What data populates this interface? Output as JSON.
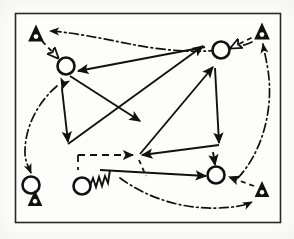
{
  "figure": {
    "background_color": "#fdfdfc",
    "ink_color": "#111111",
    "canvas": {
      "width": 294,
      "height": 239
    }
  },
  "frame": {
    "name": "border-frame",
    "x": 15,
    "y": 13,
    "width": 265,
    "height": 209,
    "stroke": "#2a2a2a",
    "stroke_width": 1.6
  },
  "nodes": {
    "circles": [
      {
        "id": "c1",
        "label": "",
        "cx": 66,
        "cy": 66,
        "r": 8.5
      },
      {
        "id": "c2",
        "label": "",
        "cx": 221,
        "cy": 50,
        "r": 8.5
      },
      {
        "id": "c3",
        "label": "",
        "cx": 31,
        "cy": 185,
        "r": 8.5
      },
      {
        "id": "c4",
        "label": "",
        "cx": 82,
        "cy": 186,
        "r": 8.5
      },
      {
        "id": "c5",
        "label": "",
        "cx": 216,
        "cy": 175,
        "r": 8.5
      }
    ],
    "triangles": [
      {
        "id": "t1",
        "label": "",
        "cx": 36,
        "cy": 33,
        "size": 8.5
      },
      {
        "id": "t2",
        "label": "",
        "cx": 262,
        "cy": 31,
        "size": 8.5
      },
      {
        "id": "t3",
        "label": "",
        "cx": 35,
        "cy": 198,
        "size": 8.0
      },
      {
        "id": "t4",
        "label": "",
        "cx": 262,
        "cy": 189,
        "size": 8.0
      }
    ]
  },
  "edges": {
    "solid": [
      {
        "id": "s1",
        "from": "c2",
        "to": "c1",
        "style": "solid"
      },
      {
        "id": "s2",
        "from": "c1",
        "to": "mid-right",
        "style": "solid"
      },
      {
        "id": "s3",
        "from": "left-spine-top",
        "to": "left-spine-bottom",
        "style": "solid"
      },
      {
        "id": "s4",
        "from": "left-lower",
        "to": "upper-right",
        "style": "solid"
      },
      {
        "id": "s5",
        "from": "c5",
        "to": "junction",
        "style": "solid"
      },
      {
        "id": "s6",
        "from": "right-upper",
        "to": "right-lower",
        "style": "solid"
      },
      {
        "id": "s7",
        "from": "junction",
        "to": "c5",
        "style": "solid"
      },
      {
        "id": "s8",
        "from": "zigzag-line",
        "to": "c5",
        "style": "solid"
      }
    ],
    "dashed": [
      {
        "id": "d1",
        "from": "left-lower",
        "to": "junction",
        "style": "dashed"
      },
      {
        "id": "d2",
        "from": "t4",
        "to": "c5",
        "style": "dashed"
      },
      {
        "id": "d3",
        "from": "t1",
        "to": "c1",
        "style": "dashed"
      },
      {
        "id": "d4",
        "from": "c2",
        "to": "t2",
        "style": "dashed"
      }
    ],
    "dashdot": [
      {
        "id": "dd1",
        "from": "top-arc-right",
        "to": "t1",
        "style": "dash-dot"
      },
      {
        "id": "dd2",
        "from": "left-arc-top",
        "to": "c3",
        "style": "dash-dot"
      },
      {
        "id": "dd3",
        "from": "right-arc",
        "to": "t2",
        "style": "dash-dot"
      },
      {
        "id": "dd4",
        "from": "bottom-arc",
        "to": "bottom-right",
        "style": "dash-dot"
      }
    ],
    "zigzag": [
      {
        "id": "z1",
        "from": "c4",
        "to": "horizontal-run",
        "style": "zigzag",
        "cycles": 4
      }
    ]
  },
  "legend": {
    "solid_meaning": "",
    "dashed_meaning": "",
    "dashdot_meaning": ""
  }
}
